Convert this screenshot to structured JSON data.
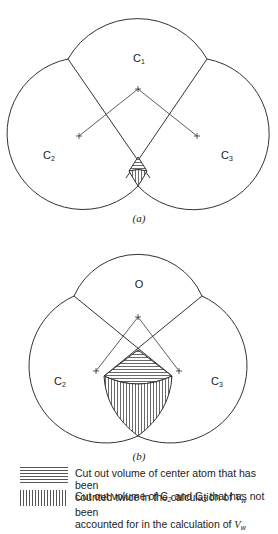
{
  "diagram_a": {
    "caption": "(a)",
    "labels": {
      "top": "C",
      "top_sub": "1",
      "left": "C",
      "left_sub": "2",
      "right": "C",
      "right_sub": "3"
    }
  },
  "diagram_b": {
    "caption": "(b)",
    "labels": {
      "top": "O",
      "left": "C",
      "left_sub": "2",
      "right": "C",
      "right_sub": "3"
    }
  },
  "legend": {
    "items": [
      {
        "pattern": "horizontal-hatch",
        "line1": "Cut out volume of center atom that has been",
        "line2_prefix": "counted twice in the calculation of ",
        "variable": "V",
        "variable_sub": "w"
      },
      {
        "pattern": "vertical-hatch",
        "line1_prefix": "Cut out volume of C",
        "line1_sub1": "2",
        "line1_mid": " and C",
        "line1_sub2": "3",
        "line1_suffix": " that has not been",
        "line2_prefix": "accounted for in the calculation of ",
        "variable": "V",
        "variable_sub": "w"
      }
    ]
  }
}
